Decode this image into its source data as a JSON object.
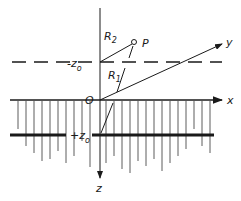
{
  "diagram": {
    "labels": {
      "x_axis": "x",
      "y_axis": "y",
      "z_axis": "z",
      "origin": "O",
      "point": "P",
      "r1": "R",
      "r1_sub": "1",
      "r2": "R",
      "r2_sub": "2",
      "minus_z0": "-z",
      "minus_z0_sub": "o",
      "plus_z0": "+z",
      "plus_z0_sub": "o"
    },
    "colors": {
      "ink": "#1a1a1a",
      "background": "#ffffff"
    }
  }
}
